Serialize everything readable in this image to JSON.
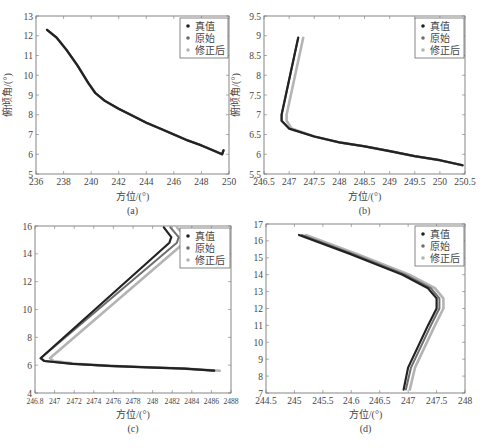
{
  "figure": {
    "caption": ""
  },
  "legend": {
    "entries": [
      "真值",
      "原始",
      "修正后"
    ],
    "colors": [
      "#222222",
      "#6e6e6e",
      "#b4b4b4"
    ]
  },
  "chart_data": [
    {
      "id": "a",
      "type": "line",
      "panel_label": "(a)",
      "xlabel": "方位/(°)",
      "ylabel": "俯倾角/(°)",
      "xlim": [
        236,
        250
      ],
      "ylim": [
        5,
        13
      ],
      "xticks": [
        236,
        238,
        240,
        242,
        244,
        246,
        248,
        250
      ],
      "yticks": [
        5,
        6,
        7,
        8,
        9,
        10,
        11,
        12,
        13
      ],
      "legend_position": "upper right",
      "grid": false,
      "series": [
        {
          "name": "真值",
          "x": [
            236.8,
            237.5,
            238.2,
            239.0,
            239.8,
            240.3,
            241.0,
            242.0,
            243.0,
            244.0,
            245.0,
            246.0,
            247.0,
            248.0,
            249.0,
            249.5,
            249.6
          ],
          "y": [
            12.3,
            11.9,
            11.3,
            10.5,
            9.6,
            9.1,
            8.7,
            8.3,
            7.95,
            7.6,
            7.3,
            7.0,
            6.7,
            6.45,
            6.15,
            6.0,
            6.2
          ]
        },
        {
          "name": "原始",
          "x": [
            236.8,
            237.5,
            238.2,
            239.0,
            239.8,
            240.3,
            241.0,
            242.0,
            243.0,
            244.0,
            245.0,
            246.0,
            247.0,
            248.0,
            249.0,
            249.5,
            249.6
          ],
          "y": [
            12.3,
            11.9,
            11.3,
            10.5,
            9.6,
            9.1,
            8.7,
            8.3,
            7.95,
            7.6,
            7.3,
            7.0,
            6.7,
            6.45,
            6.15,
            6.0,
            6.2
          ]
        },
        {
          "name": "修正后",
          "x": [
            236.8,
            237.5,
            238.2,
            239.0,
            239.8,
            240.3,
            241.0,
            242.0,
            243.0,
            244.0,
            245.0,
            246.0,
            247.0,
            248.0,
            249.0,
            249.5,
            249.6
          ],
          "y": [
            12.3,
            11.9,
            11.3,
            10.5,
            9.6,
            9.1,
            8.7,
            8.3,
            7.95,
            7.6,
            7.3,
            7.0,
            6.7,
            6.45,
            6.15,
            6.0,
            6.2
          ]
        }
      ]
    },
    {
      "id": "b",
      "type": "line",
      "panel_label": "(b)",
      "xlabel": "方位/(°)",
      "ylabel": "俯倾角/(°)",
      "xlim": [
        246.5,
        250.5
      ],
      "ylim": [
        5.5,
        9.5
      ],
      "xticks": [
        246.5,
        247,
        247.5,
        248,
        248.5,
        249,
        249.5,
        250,
        250.5
      ],
      "yticks": [
        5.5,
        6,
        6.5,
        7,
        7.5,
        8,
        8.5,
        9,
        9.5
      ],
      "legend_position": "upper right",
      "grid": false,
      "series": [
        {
          "name": "真值",
          "x": [
            247.18,
            246.85,
            246.85,
            247.0,
            247.5,
            248.0,
            248.5,
            249.0,
            249.5,
            250.0,
            250.45
          ],
          "y": [
            8.95,
            7.0,
            6.85,
            6.65,
            6.45,
            6.3,
            6.2,
            6.08,
            5.95,
            5.85,
            5.72
          ]
        },
        {
          "name": "原始",
          "x": [
            247.18,
            246.85,
            246.85,
            247.0,
            247.5,
            248.0,
            248.5,
            249.0,
            249.5,
            250.0,
            250.45
          ],
          "y": [
            8.95,
            7.0,
            6.85,
            6.65,
            6.45,
            6.3,
            6.2,
            6.08,
            5.95,
            5.85,
            5.72
          ]
        },
        {
          "name": "修正后",
          "x": [
            247.28,
            246.95,
            246.95,
            247.05,
            247.5,
            248.0,
            248.5,
            249.0,
            249.5,
            250.0,
            250.45
          ],
          "y": [
            8.95,
            7.0,
            6.85,
            6.65,
            6.45,
            6.3,
            6.2,
            6.08,
            5.95,
            5.85,
            5.72
          ]
        }
      ]
    },
    {
      "id": "c",
      "type": "line",
      "panel_label": "(c)",
      "xlabel": "方位/(°)",
      "ylabel": "",
      "xlim": [
        246.8,
        248.9
      ],
      "ylim": [
        4,
        16
      ],
      "xticks": [
        "246.8",
        "247",
        "2472",
        "2474",
        "2476",
        "2478",
        "248",
        "2482",
        "2484",
        "2486",
        "2488"
      ],
      "yticks": [
        4,
        6,
        8,
        10,
        12,
        14,
        16
      ],
      "legend_position": "upper right",
      "grid": false,
      "series": [
        {
          "name": "真值",
          "x": [
            248.18,
            248.26,
            248.24,
            246.86,
            246.9,
            247.2,
            247.6,
            248.0,
            248.4,
            248.72
          ],
          "y": [
            15.9,
            15.2,
            14.8,
            6.5,
            6.3,
            6.1,
            5.95,
            5.85,
            5.75,
            5.6
          ]
        },
        {
          "name": "原始",
          "x": [
            248.25,
            248.34,
            248.32,
            246.86,
            246.9,
            247.2,
            247.6,
            248.0,
            248.4,
            248.72
          ],
          "y": [
            15.9,
            15.2,
            14.8,
            6.5,
            6.3,
            6.1,
            5.95,
            5.85,
            5.75,
            5.6
          ]
        },
        {
          "name": "修正后",
          "x": [
            248.32,
            248.42,
            248.4,
            246.96,
            247.0,
            247.25,
            247.6,
            248.0,
            248.4,
            248.78
          ],
          "y": [
            15.9,
            15.2,
            14.8,
            6.5,
            6.3,
            6.1,
            5.95,
            5.85,
            5.75,
            5.6
          ]
        }
      ]
    },
    {
      "id": "d",
      "type": "line",
      "panel_label": "(d)",
      "xlabel": "方位/(°)",
      "ylabel": "",
      "xlim": [
        244.5,
        248
      ],
      "ylim": [
        7,
        17
      ],
      "xticks": [
        "244.5",
        "245",
        "245.5",
        "24.6",
        "246.5",
        "247",
        "247.5",
        "248"
      ],
      "yticks": [
        7,
        8,
        9,
        10,
        11,
        12,
        13,
        14,
        15,
        16,
        17
      ],
      "legend_position": "upper right",
      "grid": false,
      "series": [
        {
          "name": "真值",
          "x": [
            245.08,
            246.0,
            246.9,
            247.35,
            247.5,
            247.5,
            247.35,
            247.0,
            246.92
          ],
          "y": [
            16.35,
            15.2,
            14.0,
            13.2,
            12.6,
            12.0,
            11.0,
            8.5,
            7.2
          ]
        },
        {
          "name": "原始",
          "x": [
            245.13,
            246.05,
            246.95,
            247.4,
            247.55,
            247.55,
            247.4,
            247.05,
            246.96
          ],
          "y": [
            16.35,
            15.2,
            14.0,
            13.2,
            12.6,
            12.0,
            11.0,
            8.5,
            7.2
          ]
        },
        {
          "name": "修正后",
          "x": [
            245.2,
            246.12,
            247.02,
            247.47,
            247.62,
            247.62,
            247.47,
            247.12,
            247.03
          ],
          "y": [
            16.35,
            15.2,
            14.0,
            13.2,
            12.6,
            12.0,
            11.0,
            8.5,
            7.2
          ]
        }
      ]
    }
  ]
}
